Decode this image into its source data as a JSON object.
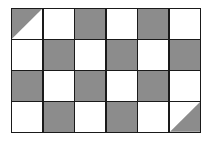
{
  "figure": {
    "columns": 6,
    "rows": 4,
    "colors": {
      "shaded": "#8c8c8c",
      "unshaded": "#ffffff",
      "line": "#1a1a1a"
    },
    "cells": [
      [
        "tri-upper-left",
        "white",
        "gray",
        "white",
        "gray",
        "white"
      ],
      [
        "white",
        "gray",
        "white",
        "gray",
        "white",
        "gray"
      ],
      [
        "gray",
        "white",
        "gray",
        "white",
        "gray",
        "white"
      ],
      [
        "white",
        "gray",
        "white",
        "gray",
        "white",
        "tri-lower-right"
      ]
    ]
  }
}
